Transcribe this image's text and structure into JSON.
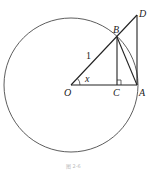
{
  "diagram": {
    "labels": {
      "O": "O",
      "A": "A",
      "B": "B",
      "C": "C",
      "D": "D",
      "radius": "1",
      "angle": "x"
    },
    "caption": "图 2-6",
    "colors": {
      "stroke": "#222222",
      "background": "#ffffff"
    }
  }
}
